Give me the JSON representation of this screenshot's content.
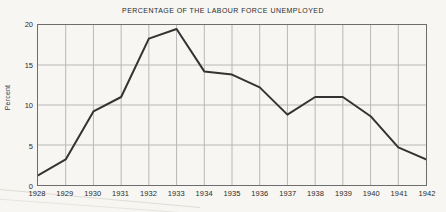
{
  "chart_data": {
    "type": "line",
    "title": "PERCENTAGE OF THE LABOUR FORCE UNEMPLOYED",
    "xlabel": "",
    "ylabel": "Percent",
    "x": [
      1928,
      1929,
      1930,
      1931,
      1932,
      1933,
      1934,
      1935,
      1936,
      1937,
      1938,
      1939,
      1940,
      1941,
      1942
    ],
    "values": [
      1.2,
      3.2,
      9.2,
      11.0,
      18.3,
      19.5,
      14.2,
      13.8,
      12.2,
      8.8,
      11.0,
      11.0,
      8.6,
      4.7,
      3.2
    ],
    "series": [
      {
        "name": "Percentage of the labour force unemployed",
        "values": [
          1.2,
          3.2,
          9.2,
          11.0,
          18.3,
          19.5,
          14.2,
          13.8,
          12.2,
          8.8,
          11.0,
          11.0,
          8.6,
          4.7,
          3.2
        ]
      }
    ],
    "categories": [
      "1928",
      "1929",
      "1930",
      "1931",
      "1932",
      "1933",
      "1934",
      "1935",
      "1936",
      "1937",
      "1938",
      "1939",
      "1940",
      "1941",
      "1942"
    ],
    "xlim": [
      1928,
      1942
    ],
    "ylim": [
      0,
      20
    ],
    "ytick_labels": [
      "0",
      "5",
      "10",
      "15",
      "20"
    ],
    "ytick_values": [
      0,
      5,
      10,
      15,
      20
    ],
    "xtick_labels": [
      "1928",
      "1929",
      "1930",
      "1931",
      "1932",
      "1933",
      "1934",
      "1935",
      "1936",
      "1937",
      "1938",
      "1939",
      "1940",
      "1941",
      "1942"
    ],
    "grid": true,
    "grid_axis": "both",
    "legend": "none",
    "line_color": "#333333",
    "grid_color": "#b8b8b8",
    "axis_color": "#6d6d6d",
    "background_color": "#f7f6f2",
    "annotations": []
  }
}
